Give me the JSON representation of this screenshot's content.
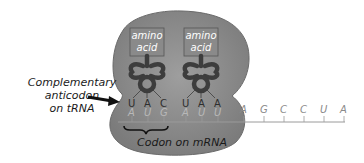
{
  "diagram": {
    "ribosome": {
      "color": "#8c8c8c",
      "shadow": "#6f6f6f"
    },
    "trnas": [
      {
        "amino_acid_label_line1": "amino",
        "amino_acid_label_line2": "acid",
        "anticodon": [
          "U",
          "A",
          "C"
        ]
      },
      {
        "amino_acid_label_line1": "amino",
        "amino_acid_label_line2": "acid",
        "anticodon": [
          "U",
          "A",
          "A"
        ]
      }
    ],
    "mrna": {
      "bases_in_ribosome": [
        "A",
        "U",
        "G",
        "A",
        "U",
        "U"
      ],
      "bases_outside": [
        "A",
        "G",
        "C",
        "C",
        "U",
        "A"
      ]
    },
    "labels": {
      "anticodon_line1": "Complementary",
      "anticodon_line2": "anticodon",
      "anticodon_line3": "on tRNA",
      "codon": "Codon on mRNA"
    },
    "colors": {
      "trna": "#3d3d3d",
      "trna_inner": "#7a7a7a",
      "mrna_line": "#9a9a9a",
      "arrow": "#111111"
    }
  }
}
